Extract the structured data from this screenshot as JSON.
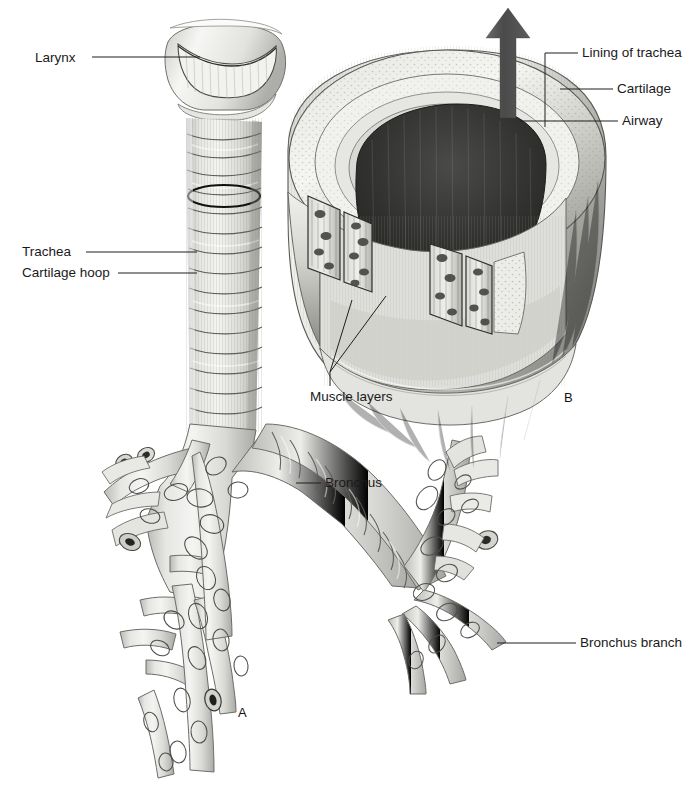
{
  "figure": {
    "title_visible": false,
    "background_color": "#ffffff",
    "ink_color": "#1a1a1a",
    "panels": [
      {
        "id": "A",
        "letter": "A",
        "x": 243,
        "y": 712,
        "subject": "trachea-and-bronchial-tree"
      },
      {
        "id": "B",
        "letter": "B",
        "x": 566,
        "y": 397,
        "subject": "trachea-cutaway-cross-section"
      }
    ]
  },
  "labels": [
    {
      "key": "larynx",
      "text": "Larynx",
      "x": 35,
      "y": 51,
      "align": "left",
      "target": "larynx-cartilage"
    },
    {
      "key": "trachea",
      "text": "Trachea",
      "x": 22,
      "y": 247,
      "align": "left",
      "target": "trachea-tube"
    },
    {
      "key": "cartilage_hoop",
      "text": "Cartilage hoop",
      "x": 22,
      "y": 268,
      "align": "left",
      "target": "cartilage-hoop-ring"
    },
    {
      "key": "bronchus",
      "text": "Bronchus",
      "x": 325,
      "y": 477,
      "align": "left",
      "target": "right-main-bronchus"
    },
    {
      "key": "bronchus_branch",
      "text": "Bronchus branch",
      "x": 580,
      "y": 637,
      "align": "left",
      "target": "bronchus-branch"
    },
    {
      "key": "muscle_layers",
      "text": "Muscle layers",
      "x": 310,
      "y": 391,
      "align": "left",
      "target": "muscle-layer-panels"
    },
    {
      "key": "lining_of_trachea",
      "text": "Lining of trachea",
      "x": 582,
      "y": 47,
      "align": "left",
      "target": "tracheal-lining"
    },
    {
      "key": "cartilage",
      "text": "Cartilage",
      "x": 617,
      "y": 83,
      "align": "left",
      "target": "cartilage-ring"
    },
    {
      "key": "airway",
      "text": "Airway",
      "x": 622,
      "y": 115,
      "align": "left",
      "target": "airway-lumen"
    }
  ],
  "leader_lines": [
    {
      "key": "larynx",
      "points": "92,57 200,57"
    },
    {
      "key": "trachea",
      "points": "86,252 197,252"
    },
    {
      "key": "cartilage_hoop",
      "points": "118,273 197,273"
    },
    {
      "key": "bronchus",
      "points": "296,483 321,483"
    },
    {
      "key": "bronchus_branch",
      "points": "497,643 576,643"
    },
    {
      "key": "muscle_layers",
      "points": "330,385 330,372 350,300"
    },
    {
      "key": "muscle_layers_2",
      "points": "330,372 385,296"
    },
    {
      "key": "lining_of_trachea",
      "points": "578,53 545,53 545,127"
    },
    {
      "key": "cartilage",
      "points": "613,89 560,89"
    },
    {
      "key": "airway",
      "points": "618,121 520,121"
    }
  ],
  "colors": {
    "arrow_dark": "#4a4a4a",
    "lumen_dark": "#2a2a2a",
    "tissue_light": "#e9e9e7",
    "tissue_mid": "#cfcfcc",
    "tissue_shade": "#a9a9a6",
    "outline": "#3a3a3a"
  },
  "arrow": {
    "name": "airflow-arrow",
    "direction": "up",
    "description": "dark gray arrow rising out of the airway lumen"
  }
}
